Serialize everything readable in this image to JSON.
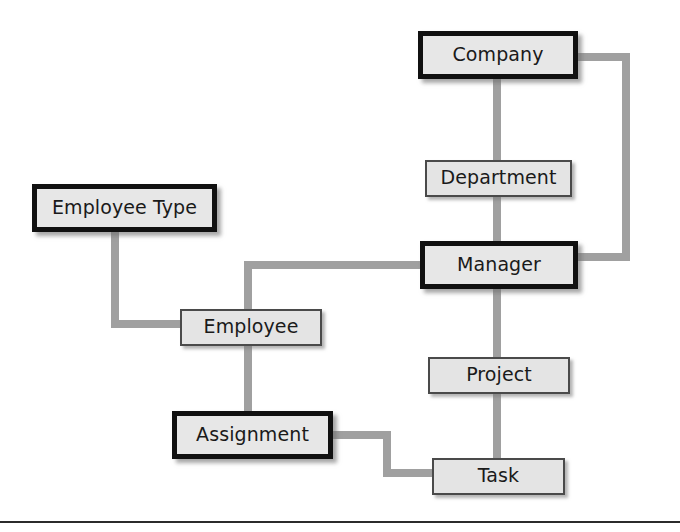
{
  "diagram": {
    "type": "entity-relationship-diagram",
    "background_color": "#ffffff",
    "connector_color": "#a0a0a0",
    "node_fill_color": "#e6e6e6",
    "node_border_color_strong": "#111111",
    "node_border_color_light": "#4a4a4a",
    "nodes": [
      {
        "id": "company",
        "label": "Company",
        "emphasis": "thick",
        "x": 418,
        "y": 31,
        "w": 160,
        "h": 48
      },
      {
        "id": "department",
        "label": "Department",
        "emphasis": "thin",
        "x": 425,
        "y": 160,
        "w": 147,
        "h": 37
      },
      {
        "id": "manager",
        "label": "Manager",
        "emphasis": "thick",
        "x": 420,
        "y": 241,
        "w": 158,
        "h": 48
      },
      {
        "id": "employee_type",
        "label": "Employee Type",
        "emphasis": "thick",
        "x": 32,
        "y": 184,
        "w": 185,
        "h": 48
      },
      {
        "id": "employee",
        "label": "Employee",
        "emphasis": "thin",
        "x": 180,
        "y": 309,
        "w": 142,
        "h": 37
      },
      {
        "id": "project",
        "label": "Project",
        "emphasis": "thin",
        "x": 428,
        "y": 357,
        "w": 142,
        "h": 37
      },
      {
        "id": "assignment",
        "label": "Assignment",
        "emphasis": "thick",
        "x": 172,
        "y": 411,
        "w": 161,
        "h": 48
      },
      {
        "id": "task",
        "label": "Task",
        "emphasis": "thin",
        "x": 432,
        "y": 458,
        "w": 133,
        "h": 37
      }
    ],
    "edges": [
      {
        "id": "company-department",
        "from": "company",
        "to": "department"
      },
      {
        "id": "department-manager",
        "from": "department",
        "to": "manager"
      },
      {
        "id": "company-manager",
        "from": "company",
        "to": "manager"
      },
      {
        "id": "manager-employee",
        "from": "manager",
        "to": "employee"
      },
      {
        "id": "employeetype-employee",
        "from": "employee_type",
        "to": "employee"
      },
      {
        "id": "employee-assignment",
        "from": "employee",
        "to": "assignment"
      },
      {
        "id": "manager-project",
        "from": "manager",
        "to": "project"
      },
      {
        "id": "project-task",
        "from": "project",
        "to": "task"
      },
      {
        "id": "assignment-task",
        "from": "assignment",
        "to": "task"
      }
    ],
    "footer_rule": {
      "y": 521,
      "thickness": 2,
      "color": "#2b2b2b"
    }
  }
}
